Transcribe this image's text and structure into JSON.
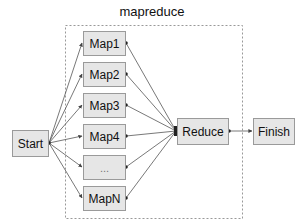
{
  "diagram": {
    "title": "mapreduce",
    "nodes": {
      "start": "Start",
      "maps": [
        "Map1",
        "Map2",
        "Map3",
        "Map4",
        "...",
        "MapN"
      ],
      "reduce": "Reduce",
      "finish": "Finish"
    },
    "edges": [
      {
        "from": "Start",
        "to": "Map1"
      },
      {
        "from": "Start",
        "to": "Map2"
      },
      {
        "from": "Start",
        "to": "Map3"
      },
      {
        "from": "Start",
        "to": "Map4"
      },
      {
        "from": "Start",
        "to": "..."
      },
      {
        "from": "Start",
        "to": "MapN"
      },
      {
        "from": "Map1",
        "to": "Reduce"
      },
      {
        "from": "Map2",
        "to": "Reduce"
      },
      {
        "from": "Map3",
        "to": "Reduce"
      },
      {
        "from": "Map4",
        "to": "Reduce"
      },
      {
        "from": "...",
        "to": "Reduce"
      },
      {
        "from": "MapN",
        "to": "Reduce"
      },
      {
        "from": "Reduce",
        "to": "Finish"
      }
    ],
    "colors": {
      "node_fill": "#e6e6e6",
      "node_border": "#9a9a9a",
      "edge": "#555555",
      "group_border": "#999999"
    }
  }
}
